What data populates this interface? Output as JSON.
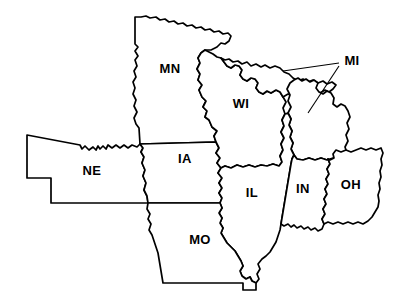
{
  "map": {
    "title": "Midwest United States Outline Map",
    "type": "political-outline-map",
    "region": "Midwestern United States",
    "width": 409,
    "height": 302,
    "background_color": "#ffffff",
    "outline_color": "#000000",
    "fill_color": "#ffffff",
    "label_color": "#000000",
    "states": [
      {
        "code": "MN",
        "name": "Minnesota",
        "label": "MN",
        "label_x": 170,
        "label_y": 70,
        "has_leader_line": false
      },
      {
        "code": "WI",
        "name": "Wisconsin",
        "label": "WI",
        "label_x": 241,
        "label_y": 105,
        "has_leader_line": false
      },
      {
        "code": "MI",
        "name": "Michigan",
        "label": "MI",
        "label_x": 352,
        "label_y": 62,
        "has_leader_line": true,
        "leader_lines": [
          {
            "x1": 339,
            "y1": 63,
            "x2": 283,
            "y2": 71
          },
          {
            "x1": 339,
            "y1": 66,
            "x2": 308,
            "y2": 113
          }
        ]
      },
      {
        "code": "IA",
        "name": "Iowa",
        "label": "IA",
        "label_x": 185,
        "label_y": 160,
        "has_leader_line": false
      },
      {
        "code": "NE",
        "name": "Nebraska",
        "label": "NE",
        "label_x": 92,
        "label_y": 172,
        "has_leader_line": false
      },
      {
        "code": "IL",
        "name": "Illinois",
        "label": "IL",
        "label_x": 252,
        "label_y": 194,
        "has_leader_line": false
      },
      {
        "code": "IN",
        "name": "Indiana",
        "label": "IN",
        "label_x": 303,
        "label_y": 190,
        "has_leader_line": false
      },
      {
        "code": "OH",
        "name": "Ohio",
        "label": "OH",
        "label_x": 351,
        "label_y": 186,
        "has_leader_line": false
      },
      {
        "code": "MO",
        "name": "Missouri",
        "label": "MO",
        "label_x": 200,
        "label_y": 241,
        "has_leader_line": false
      }
    ]
  }
}
